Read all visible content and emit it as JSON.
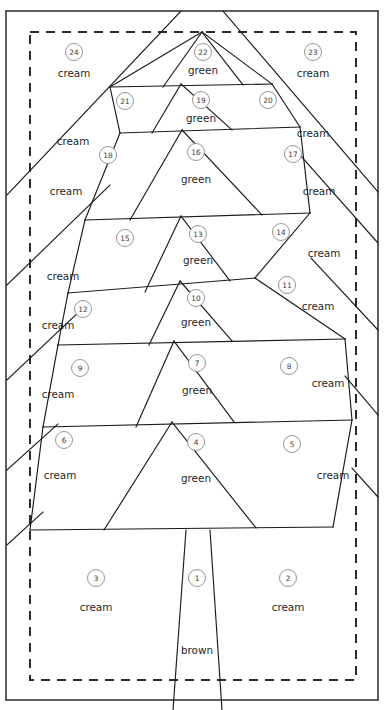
{
  "document": {
    "title": "Christmas Tree Foundation Piecing Pattern",
    "canvas": {
      "width": 390,
      "height": 710
    },
    "colors": {
      "line": "#1a1a1a",
      "seam_dash": "#2b2b2b",
      "circle_stroke": "#8a8a8a",
      "background": "#ffffff",
      "label_text": "#1f1f1f",
      "number_text": "#3b3b3b"
    }
  },
  "borders": {
    "outer": {
      "x": 6,
      "y": 11,
      "width": 372,
      "height": 689
    },
    "seam_allowance_dashed": {
      "x": 30,
      "y": 32,
      "width": 326,
      "height": 648
    }
  },
  "trunk": {
    "label": "brown",
    "top_left_x": 186,
    "top_right_x": 210,
    "bottom_left_x": 173,
    "bottom_right_x": 222,
    "top_y": 530,
    "bottom_y": 710
  },
  "pieces": [
    {
      "number": "1",
      "fabric": "brown",
      "circle": {
        "x": 197,
        "y": 578
      },
      "label": {
        "x": 197,
        "y": 650
      }
    },
    {
      "number": "2",
      "fabric": "cream",
      "circle": {
        "x": 288,
        "y": 578
      },
      "label": {
        "x": 288,
        "y": 607
      }
    },
    {
      "number": "3",
      "fabric": "cream",
      "circle": {
        "x": 96,
        "y": 578
      },
      "label": {
        "x": 96,
        "y": 607
      }
    },
    {
      "number": "4",
      "fabric": "green",
      "circle": {
        "x": 196,
        "y": 442
      },
      "label": {
        "x": 196,
        "y": 478
      }
    },
    {
      "number": "5",
      "fabric": "cream",
      "circle": {
        "x": 292,
        "y": 444
      },
      "label": {
        "x": 333,
        "y": 475
      }
    },
    {
      "number": "6",
      "fabric": "cream",
      "circle": {
        "x": 64,
        "y": 440
      },
      "label": {
        "x": 60,
        "y": 475
      }
    },
    {
      "number": "7",
      "fabric": "green",
      "circle": {
        "x": 197,
        "y": 363
      },
      "label": {
        "x": 197,
        "y": 390
      }
    },
    {
      "number": "8",
      "fabric": "cream",
      "circle": {
        "x": 289,
        "y": 366
      },
      "label": {
        "x": 328,
        "y": 383
      }
    },
    {
      "number": "9",
      "fabric": "cream",
      "circle": {
        "x": 80,
        "y": 368
      },
      "label": {
        "x": 58,
        "y": 394
      }
    },
    {
      "number": "10",
      "fabric": "green",
      "circle": {
        "x": 196,
        "y": 298
      },
      "label": {
        "x": 196,
        "y": 322
      }
    },
    {
      "number": "11",
      "fabric": "cream",
      "circle": {
        "x": 287,
        "y": 285
      },
      "label": {
        "x": 318,
        "y": 306
      }
    },
    {
      "number": "12",
      "fabric": "cream",
      "circle": {
        "x": 83,
        "y": 309
      },
      "label": {
        "x": 58,
        "y": 325
      }
    },
    {
      "number": "13",
      "fabric": "green",
      "circle": {
        "x": 198,
        "y": 234
      },
      "label": {
        "x": 198,
        "y": 260
      }
    },
    {
      "number": "14",
      "fabric": "cream",
      "circle": {
        "x": 281,
        "y": 232
      },
      "label": {
        "x": 324,
        "y": 253
      }
    },
    {
      "number": "15",
      "fabric": "cream",
      "circle": {
        "x": 125,
        "y": 238
      },
      "label": {
        "x": 63,
        "y": 276
      }
    },
    {
      "number": "16",
      "fabric": "green",
      "circle": {
        "x": 196,
        "y": 152
      },
      "label": {
        "x": 196,
        "y": 179
      }
    },
    {
      "number": "17",
      "fabric": "cream",
      "circle": {
        "x": 293,
        "y": 154
      },
      "label": {
        "x": 319,
        "y": 191
      }
    },
    {
      "number": "18",
      "fabric": "cream",
      "circle": {
        "x": 108,
        "y": 155
      },
      "label": {
        "x": 66,
        "y": 191
      }
    },
    {
      "number": "19",
      "fabric": "green",
      "circle": {
        "x": 201,
        "y": 100
      },
      "label": {
        "x": 201,
        "y": 118
      }
    },
    {
      "number": "20",
      "fabric": "cream",
      "circle": {
        "x": 268,
        "y": 100
      },
      "label": {
        "x": 313,
        "y": 133
      }
    },
    {
      "number": "21",
      "fabric": "cream",
      "circle": {
        "x": 125,
        "y": 101
      },
      "label": {
        "x": 73,
        "y": 141
      }
    },
    {
      "number": "22",
      "fabric": "green",
      "circle": {
        "x": 203,
        "y": 52
      },
      "label": {
        "x": 203,
        "y": 70
      }
    },
    {
      "number": "23",
      "fabric": "cream",
      "circle": {
        "x": 313,
        "y": 52
      },
      "label": {
        "x": 313,
        "y": 73
      }
    },
    {
      "number": "24",
      "fabric": "cream",
      "circle": {
        "x": 74,
        "y": 52
      },
      "label": {
        "x": 74,
        "y": 73
      }
    }
  ],
  "geometry": {
    "apex": {
      "x": 202,
      "y": 32
    },
    "left_edge_paths": [
      "M181,11 L7,195",
      "M7,285 L110,185",
      "M7,380 L83,308",
      "M7,470 L58,424",
      "M7,545 L43,512"
    ],
    "right_edge_paths": [
      "M223,11 L378,192",
      "M378,243 L300,155",
      "M378,330 L311,258",
      "M378,415 L345,376",
      "M378,497 L352,468"
    ],
    "tier_paths": [
      "M202,32 L110,87 L272,84 L202,32",
      "M110,87 L120,133 L300,127 L272,84",
      "M120,133 L85,220 L310,213 L300,127",
      "M85,220 L68,293 L255,278 L310,213",
      "M68,293 L58,345 L345,339 L255,278",
      "M58,345 L43,427 L352,420 L345,339",
      "M43,427 L30,530 L333,527 L352,420"
    ],
    "tier_horizontals": [
      {
        "x1": 110,
        "y1": 87,
        "x2": 272,
        "y2": 84
      },
      {
        "x1": 120,
        "y1": 133,
        "x2": 300,
        "y2": 127
      },
      {
        "x1": 85,
        "y1": 220,
        "x2": 310,
        "y2": 213
      },
      {
        "x1": 68,
        "y1": 293,
        "x2": 255,
        "y2": 278
      },
      {
        "x1": 58,
        "y1": 345,
        "x2": 345,
        "y2": 339
      },
      {
        "x1": 43,
        "y1": 427,
        "x2": 352,
        "y2": 420
      },
      {
        "x1": 30,
        "y1": 530,
        "x2": 333,
        "y2": 527
      }
    ],
    "green_triangles": [
      {
        "apex_x": 202,
        "apex_y": 32,
        "base_left_x": 163,
        "base_left_y": 87,
        "base_right_x": 243,
        "base_right_y": 85
      },
      {
        "apex_x": 181,
        "apex_y": 84,
        "base_left_x": 152,
        "base_left_y": 133,
        "base_right_x": 232,
        "base_right_y": 130
      },
      {
        "apex_x": 182,
        "apex_y": 130,
        "base_left_x": 130,
        "base_left_y": 220,
        "base_right_x": 262,
        "base_right_y": 215
      },
      {
        "apex_x": 181,
        "apex_y": 216,
        "base_left_x": 145,
        "base_left_y": 292,
        "base_right_x": 230,
        "base_right_y": 281
      },
      {
        "apex_x": 180,
        "apex_y": 281,
        "base_left_x": 149,
        "base_left_y": 345,
        "base_right_x": 232,
        "base_right_y": 341
      },
      {
        "apex_x": 174,
        "apex_y": 341,
        "base_left_x": 136,
        "base_left_y": 427,
        "base_right_x": 234,
        "base_right_y": 422
      },
      {
        "apex_x": 172,
        "apex_y": 422,
        "base_left_x": 104,
        "base_left_y": 530,
        "base_right_x": 256,
        "base_right_y": 528
      }
    ]
  }
}
